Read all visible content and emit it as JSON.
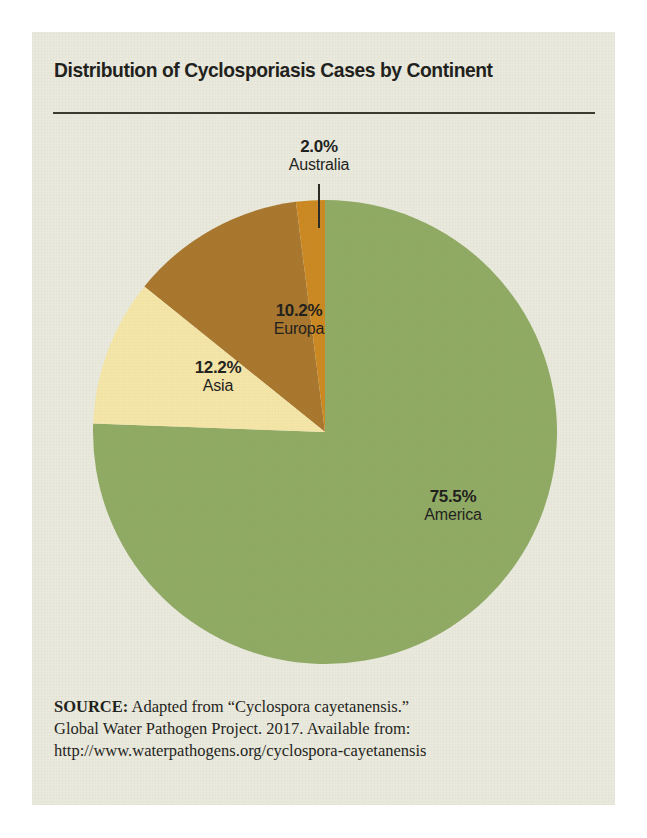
{
  "figure": {
    "title": "Distribution of Cyclosporiasis Cases by Continent",
    "background_color": "#e9e9dd",
    "page_color": "#ffffff",
    "text_color": "#1d1d1b",
    "rule_color": "#3a3a30"
  },
  "chart_data": {
    "type": "pie",
    "title": "Distribution of Cyclosporiasis Cases by Continent",
    "xlabel": "",
    "ylabel": "",
    "legend_position": "none",
    "grid": false,
    "start_angle_deg": -7.2,
    "direction": "clockwise",
    "categories": [
      "Australia",
      "America",
      "Europa",
      "Asia"
    ],
    "values": [
      2.0,
      75.5,
      10.2,
      12.2
    ],
    "unit": "%",
    "colors": [
      "#cc8820",
      "#8faa63",
      "#f5e6a8",
      "#a8762c"
    ],
    "slices": [
      {
        "name": "Australia",
        "value": 2.0,
        "pct_label": "2.0%",
        "color": "#cc8820",
        "label_placement": "outside",
        "has_leader_line": true
      },
      {
        "name": "America",
        "value": 75.5,
        "pct_label": "75.5%",
        "color": "#8faa63",
        "label_placement": "inside",
        "has_leader_line": false
      },
      {
        "name": "Europa",
        "value": 10.2,
        "pct_label": "10.2%",
        "color": "#f5e6a8",
        "label_placement": "inside",
        "has_leader_line": false
      },
      {
        "name": "Asia",
        "value": 12.2,
        "pct_label": "12.2%",
        "color": "#a8762c",
        "label_placement": "inside",
        "has_leader_line": false
      }
    ]
  },
  "source": {
    "lead": "SOURCE:",
    "line1_rest": " Adapted from “Cyclospora cayetanensis.”",
    "line2": "Global Water Pathogen Project. 2017. Available from:",
    "line3": "http://www.waterpathogens.org/cyclospora-cayetanensis"
  }
}
